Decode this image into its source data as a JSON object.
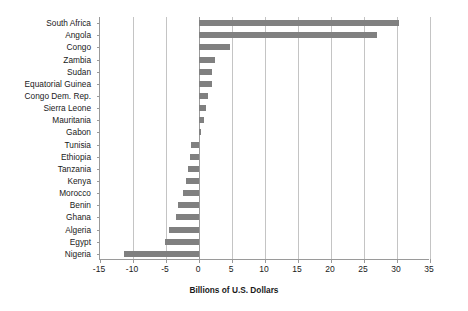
{
  "chart_data": {
    "type": "bar",
    "orientation": "horizontal",
    "title": "",
    "xlabel": "Billions of U.S. Dollars",
    "ylabel": "",
    "xlim": [
      -15,
      35
    ],
    "xticks": [
      -15,
      -10,
      -5,
      0,
      5,
      10,
      15,
      20,
      25,
      30,
      35
    ],
    "xtick_labels": [
      "-15",
      "-10",
      "-5",
      "0",
      "5",
      "10",
      "15",
      "20",
      "25",
      "30",
      "35"
    ],
    "grid": true,
    "legend": false,
    "bar_color": "#808080",
    "categories": [
      "South Africa",
      "Angola",
      "Congo",
      "Zambia",
      "Sudan",
      "Equatorial Guinea",
      "Congo Dem. Rep.",
      "Sierra Leone",
      "Mauritania",
      "Gabon",
      "Tunisia",
      "Ethiopia",
      "Tanzania",
      "Kenya",
      "Morocco",
      "Benin",
      "Ghana",
      "Algeria",
      "Egypt",
      "Nigeria"
    ],
    "values": [
      30.3,
      26.9,
      4.7,
      2.4,
      1.9,
      2.0,
      1.3,
      1.1,
      0.8,
      0.3,
      -1.2,
      -1.3,
      -1.6,
      -1.9,
      -2.5,
      -3.2,
      -3.5,
      -4.6,
      -5.1,
      -11.3
    ]
  }
}
